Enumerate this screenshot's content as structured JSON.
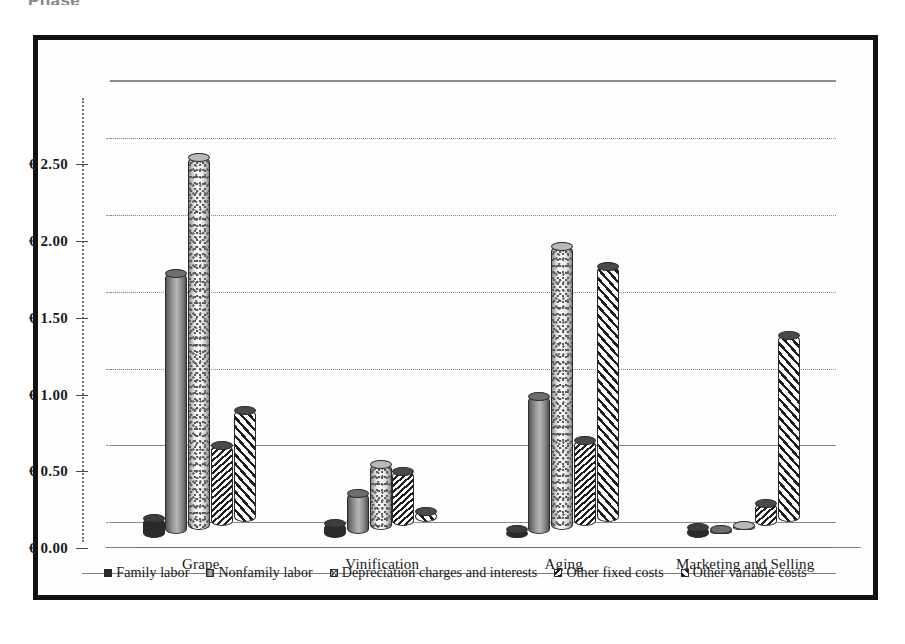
{
  "top_caption": "Phase",
  "chart_data": {
    "type": "bar",
    "title": "",
    "subtitle": "",
    "xlabel": "",
    "ylabel": "",
    "grid": true,
    "legend_position": "bottom",
    "orientation": "vertical-grouped-3d",
    "ylim": [
      0.0,
      2.75
    ],
    "ytick_values": [
      0.0,
      0.5,
      1.0,
      1.5,
      2.0,
      2.5
    ],
    "ytick_labels": [
      "€ 0.00",
      "€ 0.50",
      "€ 1.00",
      "€ 1.50",
      "€ 2.00",
      "€ 2.50"
    ],
    "currency_symbol": "€",
    "categories": [
      "Grape",
      "Vinification",
      "Aging",
      "Marketing and Selling"
    ],
    "series": [
      {
        "name": "Family labor",
        "pattern": "solid-black",
        "color": "#2a2a2a",
        "values": [
          0.13,
          0.1,
          0.06,
          0.07
        ]
      },
      {
        "name": "Nonfamily labor",
        "pattern": "gray-gradient",
        "color": "#9b9b9b",
        "values": [
          1.7,
          0.27,
          0.9,
          0.01
        ]
      },
      {
        "name": "Depreciation charges and interests",
        "pattern": "speckled-light",
        "color": "#e8e8e8",
        "values": [
          2.43,
          0.43,
          1.85,
          0.01
        ]
      },
      {
        "name": "Other fixed costs",
        "pattern": "dense-backslash-hatch",
        "color": "#1d1d1d",
        "values": [
          0.53,
          0.36,
          0.56,
          0.15
        ]
      },
      {
        "name": "Other variable costs",
        "pattern": "diagonal-slash-hatch",
        "color": "#1d1d1d",
        "values": [
          0.73,
          0.07,
          1.67,
          1.22
        ]
      }
    ]
  }
}
